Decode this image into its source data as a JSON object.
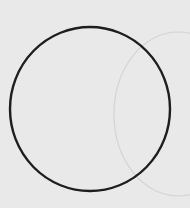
{
  "canvas": {
    "width": 190,
    "height": 208,
    "background": "#e9e9e9"
  },
  "shapes": {
    "main_circle": {
      "cx": 90,
      "cy": 109,
      "rx": 80,
      "ry": 82,
      "stroke": "#1e1e1e",
      "stroke_width": 2.4
    },
    "ghost_circle": {
      "cx": 178,
      "cy": 114,
      "rx": 64,
      "ry": 82,
      "stroke": "#d4d4d4",
      "stroke_width": 1.2
    }
  }
}
